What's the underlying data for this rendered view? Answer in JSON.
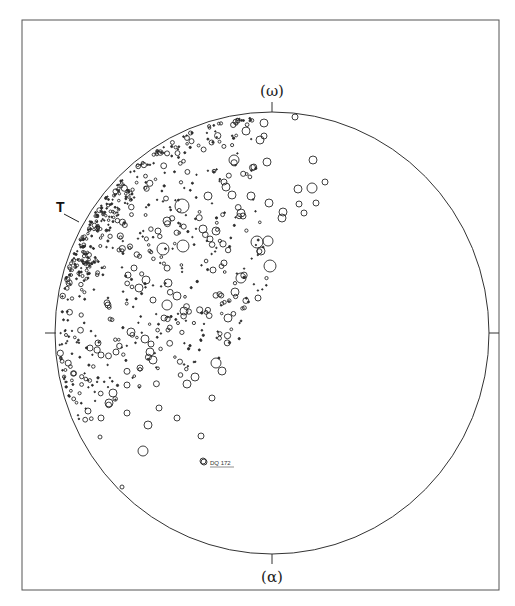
{
  "chart_data": {
    "type": "scatter",
    "subtype": "stereographic projection (pole figure) with circles sized by magnitude",
    "title": "",
    "labels": {
      "top": "(ω)",
      "bottom": "(α)",
      "marker_T": "T",
      "annotation": "DQ 172"
    },
    "frame": {
      "x": 22,
      "y": 20,
      "width": 477,
      "height": 570,
      "stroke": "#555555"
    },
    "projection_circle": {
      "cx": 272,
      "cy": 333,
      "rx": 217,
      "ry": 221,
      "stroke": "#333333"
    },
    "ticks": [
      {
        "axis": "top",
        "x": 272,
        "y1": 102,
        "y2": 112
      },
      {
        "axis": "bottom",
        "x": 272,
        "y1": 554,
        "y2": 564
      },
      {
        "axis": "left",
        "y": 333,
        "x1": 45,
        "x2": 56
      },
      {
        "axis": "right",
        "y": 333,
        "x1": 489,
        "x2": 499
      }
    ],
    "grid": false,
    "legend": null,
    "distribution": "points concentrated in the upper-left quadrant, densest along the rim near T; open circles of radius 1–7 px",
    "notable_points": [
      {
        "x": 295,
        "y": 117,
        "r": 3
      },
      {
        "x": 264,
        "y": 123,
        "r": 4
      },
      {
        "x": 264,
        "y": 136,
        "r": 3
      },
      {
        "x": 260,
        "y": 140,
        "r": 4
      },
      {
        "x": 246,
        "y": 131,
        "r": 4
      },
      {
        "x": 313,
        "y": 160,
        "r": 4
      },
      {
        "x": 267,
        "y": 162,
        "r": 4
      },
      {
        "x": 325,
        "y": 182,
        "r": 3
      },
      {
        "x": 298,
        "y": 189,
        "r": 4
      },
      {
        "x": 312,
        "y": 188,
        "r": 5
      },
      {
        "x": 316,
        "y": 203,
        "r": 3
      },
      {
        "x": 299,
        "y": 204,
        "r": 3
      },
      {
        "x": 304,
        "y": 213,
        "r": 3
      },
      {
        "x": 234,
        "y": 160,
        "r": 5
      },
      {
        "x": 251,
        "y": 196,
        "r": 4
      },
      {
        "x": 269,
        "y": 203,
        "r": 4
      },
      {
        "x": 282,
        "y": 218,
        "r": 4
      },
      {
        "x": 257,
        "y": 242,
        "r": 6
      },
      {
        "x": 268,
        "y": 241,
        "r": 5
      },
      {
        "x": 261,
        "y": 251,
        "r": 4
      },
      {
        "x": 270,
        "y": 266,
        "r": 6
      },
      {
        "x": 283,
        "y": 212,
        "r": 4
      },
      {
        "x": 241,
        "y": 213,
        "r": 4
      },
      {
        "x": 243,
        "y": 216,
        "r": 3
      },
      {
        "x": 232,
        "y": 195,
        "r": 4
      },
      {
        "x": 226,
        "y": 187,
        "r": 4
      },
      {
        "x": 224,
        "y": 182,
        "r": 3
      },
      {
        "x": 182,
        "y": 206,
        "r": 7
      },
      {
        "x": 183,
        "y": 246,
        "r": 6
      },
      {
        "x": 208,
        "y": 196,
        "r": 4
      },
      {
        "x": 216,
        "y": 231,
        "r": 4
      },
      {
        "x": 203,
        "y": 229,
        "r": 4
      },
      {
        "x": 210,
        "y": 239,
        "r": 3
      },
      {
        "x": 163,
        "y": 249,
        "r": 6
      },
      {
        "x": 167,
        "y": 221,
        "r": 4
      },
      {
        "x": 158,
        "y": 231,
        "r": 3
      },
      {
        "x": 213,
        "y": 270,
        "r": 3
      },
      {
        "x": 146,
        "y": 280,
        "r": 4
      },
      {
        "x": 139,
        "y": 288,
        "r": 4
      },
      {
        "x": 224,
        "y": 263,
        "r": 3
      },
      {
        "x": 177,
        "y": 296,
        "r": 4
      },
      {
        "x": 168,
        "y": 283,
        "r": 4
      },
      {
        "x": 235,
        "y": 292,
        "r": 4
      },
      {
        "x": 167,
        "y": 305,
        "r": 5
      },
      {
        "x": 164,
        "y": 318,
        "r": 3
      },
      {
        "x": 153,
        "y": 300,
        "r": 3
      },
      {
        "x": 184,
        "y": 311,
        "r": 4
      },
      {
        "x": 241,
        "y": 278,
        "r": 5
      },
      {
        "x": 228,
        "y": 318,
        "r": 4
      },
      {
        "x": 216,
        "y": 363,
        "r": 5
      },
      {
        "x": 222,
        "y": 371,
        "r": 4
      },
      {
        "x": 187,
        "y": 384,
        "r": 4
      },
      {
        "x": 195,
        "y": 377,
        "r": 4
      },
      {
        "x": 212,
        "y": 398,
        "r": 3
      },
      {
        "x": 153,
        "y": 360,
        "r": 4
      },
      {
        "x": 140,
        "y": 368,
        "r": 3
      },
      {
        "x": 116,
        "y": 352,
        "r": 3
      },
      {
        "x": 127,
        "y": 385,
        "r": 3
      },
      {
        "x": 113,
        "y": 393,
        "r": 4
      },
      {
        "x": 109,
        "y": 403,
        "r": 4
      },
      {
        "x": 148,
        "y": 425,
        "r": 4
      },
      {
        "x": 143,
        "y": 451,
        "r": 5
      },
      {
        "x": 127,
        "y": 413,
        "r": 3
      },
      {
        "x": 101,
        "y": 418,
        "r": 3
      },
      {
        "x": 88,
        "y": 411,
        "r": 3
      },
      {
        "x": 101,
        "y": 355,
        "r": 3
      },
      {
        "x": 131,
        "y": 332,
        "r": 4
      },
      {
        "x": 98,
        "y": 343,
        "r": 3
      },
      {
        "x": 90,
        "y": 348,
        "r": 3
      },
      {
        "x": 201,
        "y": 436,
        "r": 3
      },
      {
        "x": 203,
        "y": 461,
        "r": 3
      },
      {
        "x": 159,
        "y": 408,
        "r": 3
      },
      {
        "x": 177,
        "y": 418,
        "r": 3
      },
      {
        "x": 122,
        "y": 487,
        "r": 2
      },
      {
        "x": 100,
        "y": 437,
        "r": 2
      },
      {
        "x": 258,
        "y": 298,
        "r": 3
      },
      {
        "x": 168,
        "y": 330,
        "r": 2
      },
      {
        "x": 145,
        "y": 339,
        "r": 4
      },
      {
        "x": 151,
        "y": 344,
        "r": 3
      },
      {
        "x": 150,
        "y": 352,
        "r": 4
      },
      {
        "x": 108,
        "y": 305,
        "r": 3
      },
      {
        "x": 128,
        "y": 275,
        "r": 3
      },
      {
        "x": 134,
        "y": 268,
        "r": 3
      },
      {
        "x": 119,
        "y": 250,
        "r": 2
      }
    ],
    "dense_scatter": {
      "seed": 172,
      "count": 520,
      "r_min": 0.7,
      "r_max": 3.2,
      "angle_deg_min": 95,
      "angle_deg_max": 205,
      "rim_bias": 2.2,
      "extra_rim_band": {
        "count": 130,
        "angle_deg_min": 135,
        "angle_deg_max": 165,
        "depth": 0.1
      }
    }
  }
}
